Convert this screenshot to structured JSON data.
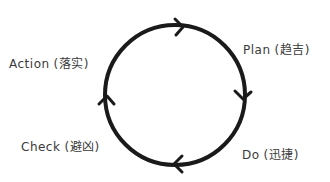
{
  "diagram": {
    "type": "cycle",
    "direction": "clockwise",
    "stroke_color": "#1a1a1a",
    "text_color": "#3a3a3a",
    "nodes": [
      {
        "id": "plan",
        "label": "Plan",
        "note": "(趋吉)",
        "position": "top-right"
      },
      {
        "id": "do",
        "label": "Do",
        "note": "(迅捷)",
        "position": "bottom-right"
      },
      {
        "id": "check",
        "label": "Check",
        "note": "(避凶)",
        "position": "bottom-left"
      },
      {
        "id": "action",
        "label": "Action",
        "note": "(落实)",
        "position": "top-left"
      }
    ],
    "edges": [
      {
        "from": "action",
        "to": "plan",
        "arrow_at": "top"
      },
      {
        "from": "plan",
        "to": "do",
        "arrow_at": "right"
      },
      {
        "from": "do",
        "to": "check",
        "arrow_at": "bottom"
      },
      {
        "from": "check",
        "to": "action",
        "arrow_at": "left"
      }
    ]
  }
}
